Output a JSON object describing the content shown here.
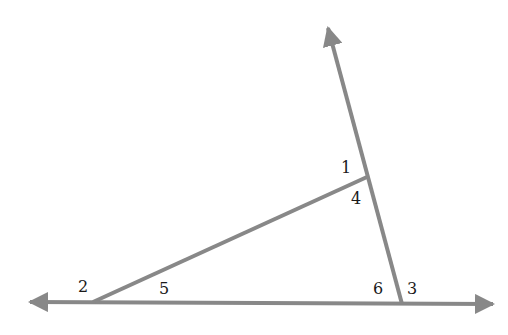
{
  "diagram": {
    "line_color": "#888888",
    "label_color": "#1a1a1a",
    "angle_labels": [
      {
        "id": "1",
        "text": "1",
        "x": 341,
        "y": 173
      },
      {
        "id": "4",
        "text": "4",
        "x": 351,
        "y": 204
      },
      {
        "id": "2",
        "text": "2",
        "x": 78,
        "y": 292
      },
      {
        "id": "5",
        "text": "5",
        "x": 159,
        "y": 294
      },
      {
        "id": "6",
        "text": "6",
        "x": 373,
        "y": 294
      },
      {
        "id": "3",
        "text": "3",
        "x": 407,
        "y": 294
      }
    ]
  }
}
